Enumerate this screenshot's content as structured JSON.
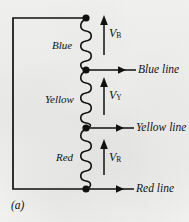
{
  "figure": {
    "caption": "(a)",
    "colors": {
      "ink": "#111111",
      "paper": "#f2f2f0"
    }
  },
  "windings": [
    {
      "id": "blue",
      "label": "Blue"
    },
    {
      "id": "yellow",
      "label": "Yellow"
    },
    {
      "id": "red",
      "label": "Red"
    }
  ],
  "voltages": [
    {
      "id": "v-blue",
      "symbol": "V",
      "subscript": "B",
      "direction": "up"
    },
    {
      "id": "v-yellow",
      "symbol": "V",
      "subscript": "Y",
      "direction": "up"
    },
    {
      "id": "v-red",
      "symbol": "V",
      "subscript": "R",
      "direction": "up"
    }
  ],
  "lines": [
    {
      "id": "blue-line",
      "label": "Blue line"
    },
    {
      "id": "yellow-line",
      "label": "Yellow line"
    },
    {
      "id": "red-line",
      "label": "Red line"
    }
  ],
  "nodes": [
    {
      "id": "top-node",
      "label": "neutral-top-terminal"
    },
    {
      "id": "blue-yellow-node",
      "label": "blue-line-tap"
    },
    {
      "id": "yellow-red-node",
      "label": "yellow-line-tap"
    },
    {
      "id": "bottom-node",
      "label": "red-line-tap"
    }
  ]
}
